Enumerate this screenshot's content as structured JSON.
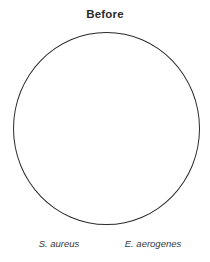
{
  "diagram": {
    "title": "Before",
    "circle": {
      "shape": "circle",
      "fill": "none",
      "stroke_color": "#2a2a2a"
    },
    "labels": {
      "left": "S. aureus",
      "right": "E. aerogenes"
    },
    "colors": {
      "background": "#ffffff",
      "title_text": "#2b2b2b",
      "label_text": "#383838"
    }
  }
}
